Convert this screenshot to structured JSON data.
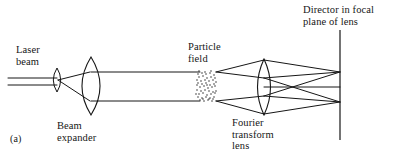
{
  "figure": {
    "panel_label": "(a)",
    "labels": {
      "laser_beam": "Laser\nbeam",
      "beam_expander": "Beam\nexpander",
      "particle_field": "Particle\nfield",
      "fourier_lens": "Fourier\ntransform\nlens",
      "detector": "Director in focal\nplane of lens"
    },
    "colors": {
      "background": "#ffffff",
      "ink": "#161616",
      "stipple": "#2a2a2a"
    },
    "geometry": {
      "width": 393,
      "height": 157,
      "laser_beam_lines": [
        {
          "x1": 8,
          "y1": 78,
          "x2": 57,
          "y2": 78
        },
        {
          "x1": 8,
          "y1": 85,
          "x2": 57,
          "y2": 85
        }
      ],
      "small_lens": {
        "cx": 57,
        "cy": 80,
        "rx": 3.5,
        "ry": 12
      },
      "expander_cone": [
        {
          "x1": 58,
          "y1": 80,
          "x2": 90,
          "y2": 72
        },
        {
          "x1": 58,
          "y1": 80,
          "x2": 90,
          "y2": 101
        }
      ],
      "big_lens": {
        "cx": 91,
        "cy": 86,
        "rx": 9.5,
        "ry": 29
      },
      "collimated_beam": [
        {
          "x1": 91,
          "y1": 72,
          "x2": 200,
          "y2": 72
        },
        {
          "x1": 91,
          "y1": 101,
          "x2": 200,
          "y2": 101
        }
      ],
      "particle_field_box": {
        "x": 197,
        "y": 72,
        "w": 19,
        "h": 30
      },
      "fourier_lens": {
        "cx": 264,
        "cy": 87,
        "rx": 6.5,
        "ry": 28
      },
      "converging_rays": [
        {
          "x1": 216,
          "y1": 72,
          "x2": 264,
          "y2": 60
        },
        {
          "x1": 216,
          "y1": 72,
          "x2": 264,
          "y2": 78
        },
        {
          "x1": 216,
          "y1": 101,
          "x2": 264,
          "y2": 96
        },
        {
          "x1": 216,
          "y1": 101,
          "x2": 264,
          "y2": 114
        }
      ],
      "output_rays": [
        {
          "x1": 264,
          "y1": 60,
          "x2": 340,
          "y2": 72
        },
        {
          "x1": 264,
          "y1": 78,
          "x2": 340,
          "y2": 72
        },
        {
          "x1": 264,
          "y1": 78,
          "x2": 340,
          "y2": 102
        },
        {
          "x1": 264,
          "y1": 96,
          "x2": 340,
          "y2": 72
        },
        {
          "x1": 264,
          "y1": 96,
          "x2": 340,
          "y2": 102
        },
        {
          "x1": 264,
          "y1": 114,
          "x2": 340,
          "y2": 102
        },
        {
          "x1": 264,
          "y1": 87,
          "x2": 340,
          "y2": 87
        }
      ],
      "detector_line": {
        "x1": 340,
        "y1": 30,
        "x2": 340,
        "y2": 140
      },
      "focus_points_y": [
        72,
        87,
        102
      ],
      "stipple_dots": [
        [
          198,
          74
        ],
        [
          202,
          73
        ],
        [
          206,
          74
        ],
        [
          210,
          73
        ],
        [
          214,
          75
        ],
        [
          199,
          77
        ],
        [
          203,
          76
        ],
        [
          207,
          78
        ],
        [
          211,
          77
        ],
        [
          215,
          78
        ],
        [
          197,
          80
        ],
        [
          201,
          81
        ],
        [
          205,
          80
        ],
        [
          209,
          81
        ],
        [
          213,
          80
        ],
        [
          198,
          83
        ],
        [
          202,
          84
        ],
        [
          206,
          83
        ],
        [
          210,
          85
        ],
        [
          214,
          84
        ],
        [
          200,
          87
        ],
        [
          204,
          86
        ],
        [
          208,
          88
        ],
        [
          212,
          87
        ],
        [
          215,
          86
        ],
        [
          197,
          90
        ],
        [
          201,
          91
        ],
        [
          205,
          90
        ],
        [
          209,
          91
        ],
        [
          213,
          92
        ],
        [
          199,
          94
        ],
        [
          203,
          93
        ],
        [
          207,
          95
        ],
        [
          211,
          94
        ],
        [
          215,
          93
        ],
        [
          198,
          97
        ],
        [
          202,
          98
        ],
        [
          206,
          97
        ],
        [
          210,
          98
        ],
        [
          214,
          97
        ],
        [
          200,
          100
        ],
        [
          204,
          101
        ],
        [
          208,
          100
        ],
        [
          212,
          101
        ],
        [
          213,
          99
        ],
        [
          199,
          71
        ],
        [
          205,
          72
        ],
        [
          211,
          71
        ],
        [
          203,
          99
        ],
        [
          209,
          99
        ],
        [
          197,
          85
        ],
        [
          207,
          85
        ],
        [
          216,
          82
        ],
        [
          216,
          91
        ],
        [
          196,
          94
        ]
      ]
    }
  }
}
